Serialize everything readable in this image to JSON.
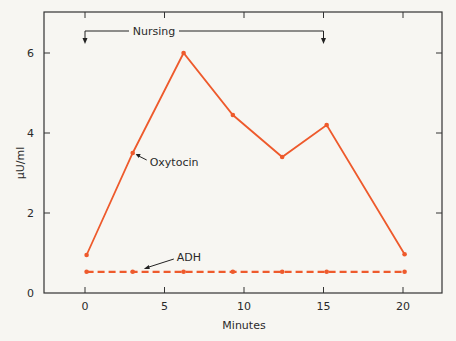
{
  "chart_data": {
    "type": "line",
    "title": "",
    "xlabel": "Minutes",
    "ylabel": "μU/ml",
    "xlim": [
      -2.6,
      22.4
    ],
    "ylim": [
      0,
      7
    ],
    "xticks": [
      0,
      5,
      10,
      15,
      20
    ],
    "yticks": [
      0,
      2,
      4,
      6
    ],
    "grid": false,
    "legend": "inline annotations",
    "series": [
      {
        "name": "Oxytocin",
        "style": "solid",
        "color": "#ee5a2c",
        "x": [
          0.1,
          3.0,
          6.2,
          9.3,
          12.4,
          15.2,
          20.1
        ],
        "y": [
          0.95,
          3.5,
          6.0,
          4.45,
          3.4,
          4.2,
          0.97
        ]
      },
      {
        "name": "ADH",
        "style": "dashed",
        "color": "#ee5a2c",
        "x": [
          0.1,
          3.0,
          6.2,
          9.3,
          12.4,
          15.2,
          20.1
        ],
        "y": [
          0.53,
          0.53,
          0.53,
          0.53,
          0.53,
          0.53,
          0.53
        ]
      }
    ],
    "annotations": [
      {
        "text": "Nursing",
        "type": "bracket",
        "x_start": 0,
        "x_end": 15,
        "y": 6.45
      },
      {
        "text": "Oxytocin",
        "type": "arrow-label",
        "points_to": [
          3.0,
          3.5
        ]
      },
      {
        "text": "ADH",
        "type": "arrow-label",
        "points_to": [
          3.7,
          0.55
        ]
      }
    ]
  }
}
